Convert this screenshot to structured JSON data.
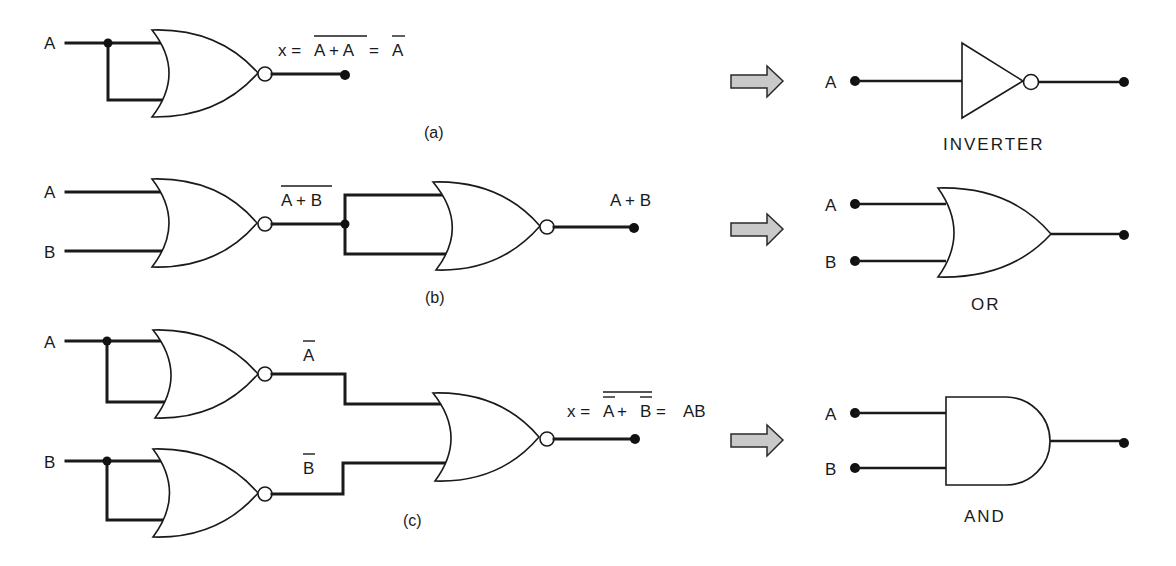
{
  "diagram": {
    "type": "logic-gate-equivalence",
    "colors": {
      "line": "#1a1a1a",
      "arrow_fill": "#c9c9c9",
      "background": "#ffffff"
    },
    "sections": [
      {
        "id": "a",
        "caption": "(a)",
        "inputs": [
          "A"
        ],
        "gates": [
          "NOR"
        ],
        "expression": {
          "prefix": "x = ",
          "overlined": "A + A",
          "equals": " = ",
          "result_overlined": "A"
        },
        "equivalent": {
          "name": "INVERTER",
          "inputs": [
            "A"
          ]
        }
      },
      {
        "id": "b",
        "caption": "(b)",
        "inputs": [
          "A",
          "B"
        ],
        "gates": [
          "NOR",
          "NOR"
        ],
        "intermediate_overlined": "A + B",
        "output_label": "A + B",
        "equivalent": {
          "name": "OR",
          "inputs": [
            "A",
            "B"
          ]
        }
      },
      {
        "id": "c",
        "caption": "(c)",
        "inputs": [
          "A",
          "B"
        ],
        "gates": [
          "NOR",
          "NOR",
          "NOR"
        ],
        "intermediate_labels": [
          "A",
          "B"
        ],
        "expression": {
          "prefix": "x = ",
          "a": "A",
          "plus": " + ",
          "b": "B",
          "equals": " = ",
          "result": "AB"
        },
        "equivalent": {
          "name": "AND",
          "inputs": [
            "A",
            "B"
          ]
        }
      }
    ],
    "arrow_icon": "right-arrow-icon"
  }
}
